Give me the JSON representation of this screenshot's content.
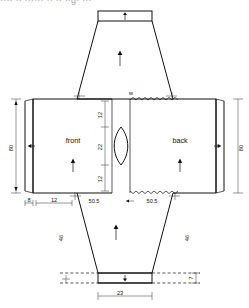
{
  "caption": {
    "text": "···· ·· ······  ·· ·· ··g· ···"
  },
  "diagram": {
    "parts": {
      "front_label": "front",
      "back_label": "back"
    },
    "dimensions": {
      "left_side_height": "80",
      "right_side_height": "80",
      "front_bottom_a": "8",
      "front_bottom_b": "12",
      "front_bottom_c": "50.5",
      "back_bottom_c": "50.5",
      "neck_upper": "12",
      "neck_middle": "22",
      "neck_lower": "12",
      "top_panel_height": "7",
      "top_flap_left": "46",
      "top_flap_right": "46",
      "bottom_flap_left": "46",
      "bottom_flap_right": "46",
      "bottom_band_width": "23",
      "bottom_band_height": "7",
      "neck_marker": "w"
    },
    "arrows": {
      "top_band_arrow": "up",
      "top_trapezoid_arrow": "up",
      "front_grain_arrow": "up",
      "back_grain_arrow": "up",
      "bottom_trapezoid_arrow": "up",
      "bottom_band_arrow": "down",
      "left_width_arrow": "left",
      "right_width_arrow": "right"
    },
    "edges": {
      "neck_seam_top": "zigzag-stitch",
      "neck_seam_bottom": "zigzag-stitch"
    },
    "colors": {
      "line": "#111111",
      "background": "#ffffff",
      "extension": "#444444"
    }
  }
}
